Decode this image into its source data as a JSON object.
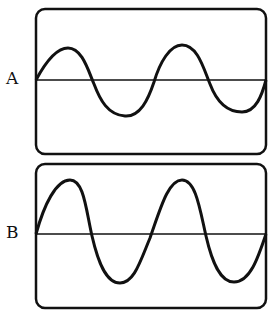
{
  "panels": [
    {
      "label": "A",
      "amplitude": "small",
      "cycles": 2,
      "description": "Sine wave with lower amplitude, same frequency"
    },
    {
      "label": "B",
      "amplitude": "large",
      "cycles": 2,
      "description": "Sine wave with higher amplitude, same frequency"
    }
  ],
  "colors": {
    "stroke": "#111111",
    "background": "#ffffff"
  }
}
